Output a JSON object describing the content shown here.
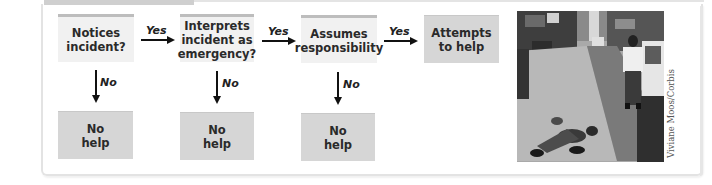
{
  "diagram": {
    "type": "flowchart",
    "steps": [
      {
        "label": "Notices\nincident?"
      },
      {
        "label": "Interprets\nincident as\nemergency?"
      },
      {
        "label": "Assumes\nresponsibility"
      },
      {
        "label": "Attempts\nto help"
      }
    ],
    "outcomes": [
      {
        "label": "No\nhelp"
      },
      {
        "label": "No\nhelp"
      },
      {
        "label": "No\nhelp"
      }
    ],
    "yes_label": "Yes",
    "no_label": "No"
  },
  "photo": {
    "description": "Man lying on city sidewalk while a pedestrian stands nearby",
    "credit": "Viviane Moos/Corbis"
  }
}
